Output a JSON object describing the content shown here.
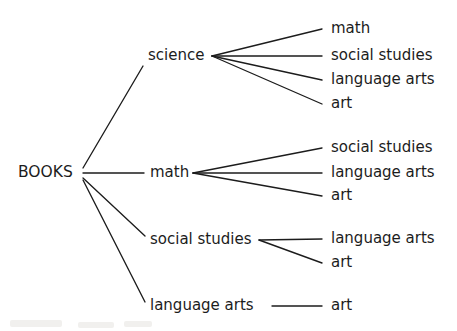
{
  "diagram": {
    "type": "tree-diagram",
    "background_color": "#ffffff",
    "ink_color": "#1c1c1c",
    "root": {
      "id": "root",
      "label": "BOOKS",
      "x": 18,
      "y": 173,
      "anchor": "left",
      "fan_x": 83,
      "fan_y": 173
    },
    "level1": [
      {
        "id": "science",
        "label": "science",
        "x": 148,
        "y": 56,
        "anchor": "left",
        "fan_x": 212,
        "fan_y": 56,
        "edge_from_root_x": 143,
        "edge_from_root_y": 66
      },
      {
        "id": "math",
        "label": "math",
        "x": 150,
        "y": 173,
        "anchor": "left",
        "fan_x": 193,
        "fan_y": 173,
        "edge_from_root_x": 144,
        "edge_from_root_y": 173
      },
      {
        "id": "social-studies",
        "label": "social studies",
        "x": 150,
        "y": 240,
        "anchor": "left",
        "fan_x": 259,
        "fan_y": 240,
        "edge_from_root_x": 145,
        "edge_from_root_y": 236
      },
      {
        "id": "language-arts",
        "label": "language arts",
        "x": 150,
        "y": 306,
        "anchor": "left",
        "fan_x": 272,
        "fan_y": 306,
        "edge_from_root_x": 145,
        "edge_from_root_y": 302
      }
    ],
    "leaves": [
      {
        "id": "science-math",
        "parent": "science",
        "label": "math",
        "x": 331,
        "y": 29,
        "line_end_x": 322,
        "line_end_y": 29
      },
      {
        "id": "science-social-studies",
        "parent": "science",
        "label": "social studies",
        "x": 331,
        "y": 56,
        "line_end_x": 322,
        "line_end_y": 56
      },
      {
        "id": "science-language-arts",
        "parent": "science",
        "label": "language arts",
        "x": 331,
        "y": 80,
        "line_end_x": 322,
        "line_end_y": 80
      },
      {
        "id": "science-art",
        "parent": "science",
        "label": "art",
        "x": 331,
        "y": 104,
        "line_end_x": 322,
        "line_end_y": 104
      },
      {
        "id": "math-social-studies",
        "parent": "math",
        "label": "social studies",
        "x": 331,
        "y": 148,
        "line_end_x": 322,
        "line_end_y": 148
      },
      {
        "id": "math-language-arts",
        "parent": "math",
        "label": "language arts",
        "x": 331,
        "y": 173,
        "line_end_x": 322,
        "line_end_y": 173
      },
      {
        "id": "math-art",
        "parent": "math",
        "label": "art",
        "x": 331,
        "y": 196,
        "line_end_x": 322,
        "line_end_y": 196
      },
      {
        "id": "ss-language-arts",
        "parent": "social-studies",
        "label": "language arts",
        "x": 331,
        "y": 239,
        "line_end_x": 322,
        "line_end_y": 239
      },
      {
        "id": "ss-art",
        "parent": "social-studies",
        "label": "art",
        "x": 331,
        "y": 263,
        "line_end_x": 322,
        "line_end_y": 263
      },
      {
        "id": "la-art",
        "parent": "language-arts",
        "label": "art",
        "x": 331,
        "y": 306,
        "line_end_x": 322,
        "line_end_y": 306
      }
    ],
    "edges": [
      {
        "id": "root-science",
        "from": "root",
        "to": "science",
        "x1": 83,
        "y1": 168,
        "x2": 143,
        "y2": 66
      },
      {
        "id": "root-math",
        "from": "root",
        "to": "math",
        "x1": 83,
        "y1": 173,
        "x2": 144,
        "y2": 173
      },
      {
        "id": "root-social-studies",
        "from": "root",
        "to": "social-studies",
        "x1": 83,
        "y1": 178,
        "x2": 145,
        "y2": 236
      },
      {
        "id": "root-language-arts",
        "from": "root",
        "to": "language-arts",
        "x1": 83,
        "y1": 180,
        "x2": 145,
        "y2": 302
      },
      {
        "id": "science-e1",
        "from": "science",
        "to": "science-math",
        "x1": 212,
        "y1": 56,
        "x2": 322,
        "y2": 29
      },
      {
        "id": "science-e2",
        "from": "science",
        "to": "science-social-studies",
        "x1": 212,
        "y1": 56,
        "x2": 322,
        "y2": 56
      },
      {
        "id": "science-e3",
        "from": "science",
        "to": "science-language-arts",
        "x1": 212,
        "y1": 56,
        "x2": 322,
        "y2": 80
      },
      {
        "id": "science-e4",
        "from": "science",
        "to": "science-art",
        "x1": 212,
        "y1": 56,
        "x2": 322,
        "y2": 104
      },
      {
        "id": "math-e1",
        "from": "math",
        "to": "math-social-studies",
        "x1": 193,
        "y1": 173,
        "x2": 322,
        "y2": 148
      },
      {
        "id": "math-e2",
        "from": "math",
        "to": "math-language-arts",
        "x1": 193,
        "y1": 173,
        "x2": 322,
        "y2": 173
      },
      {
        "id": "math-e3",
        "from": "math",
        "to": "math-art",
        "x1": 193,
        "y1": 173,
        "x2": 322,
        "y2": 196
      },
      {
        "id": "ss-e1",
        "from": "social-studies",
        "to": "ss-language-arts",
        "x1": 259,
        "y1": 240,
        "x2": 322,
        "y2": 239
      },
      {
        "id": "ss-e2",
        "from": "social-studies",
        "to": "ss-art",
        "x1": 259,
        "y1": 240,
        "x2": 322,
        "y2": 263
      },
      {
        "id": "la-e1",
        "from": "language-arts",
        "to": "la-art",
        "x1": 272,
        "y1": 306,
        "x2": 322,
        "y2": 306
      }
    ]
  }
}
